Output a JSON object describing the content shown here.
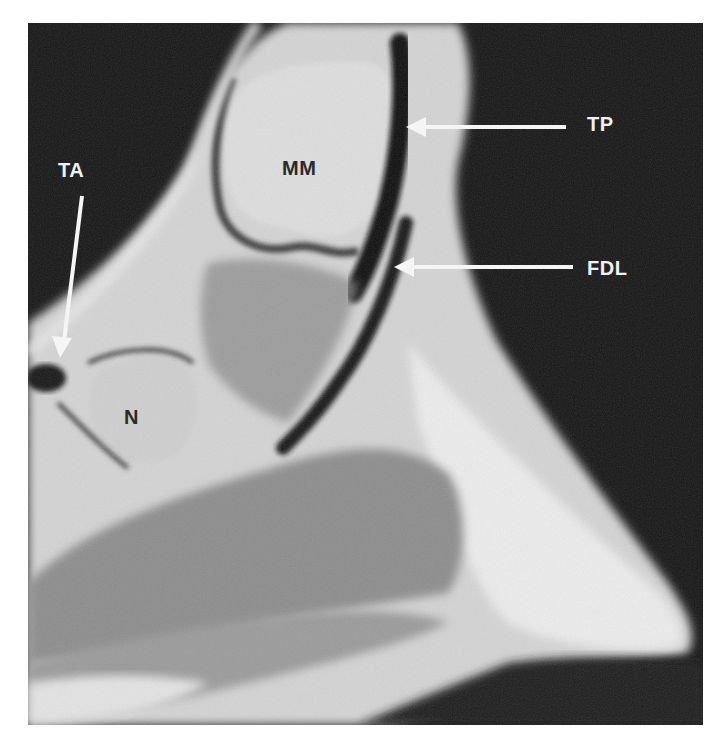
{
  "figure": {
    "type": "MRI scan, sagittal view of ankle/foot",
    "labels": {
      "tp": "TP",
      "fdl": "FDL",
      "ta": "TA",
      "mm": "MM",
      "n": "N"
    },
    "colors": {
      "background": "#111111",
      "soft_tissue": "#d8d8d8",
      "fat_bright": "#eeeeee",
      "muscle": "#8a8a8a",
      "tendon": "#1a1a1a",
      "arrow": "#f5f5f5",
      "page": "#ffffff"
    }
  }
}
